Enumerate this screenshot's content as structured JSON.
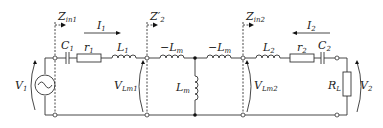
{
  "labels": {
    "zin1": "Z",
    "zin1_sub": "in1",
    "z2": "Z′",
    "z2_sub": "2",
    "zin2": "Z",
    "zin2_sub": "in2",
    "i1": "I",
    "i1_sub": "1",
    "i2": "I",
    "i2_sub": "2",
    "c1": "C",
    "c1_sub": "1",
    "r1": "r",
    "r1_sub": "1",
    "l1": "L",
    "l1_sub": "1",
    "lm_a": "−L",
    "lm_a_sub": "m",
    "lm_b": "−L",
    "lm_b_sub": "m",
    "lm": "L",
    "lm_sub": "m",
    "l2": "L",
    "l2_sub": "2",
    "r2": "r",
    "r2_sub": "2",
    "c2": "C",
    "c2_sub": "2",
    "v1": "V",
    "v1_sub": "1",
    "v2": "V",
    "v2_sub": "2",
    "vlm1": "V",
    "vlm1_sub": "Lm1",
    "vlm2": "V",
    "vlm2_sub": "Lm2",
    "rl": "R",
    "rl_sub": "L"
  }
}
